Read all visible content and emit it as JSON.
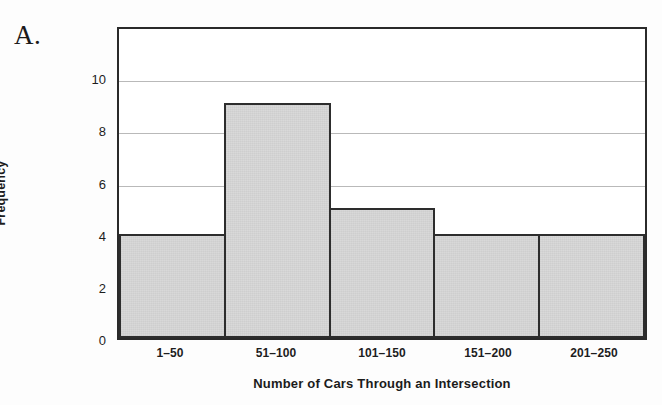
{
  "panel_letter": "A.",
  "chart_data": {
    "type": "bar",
    "title": "",
    "subtitle": "",
    "xlabel": "Number of Cars Through an Intersection",
    "ylabel": "Frequency",
    "categories": [
      "1–50",
      "51–100",
      "101–150",
      "151–200",
      "201–250"
    ],
    "values": [
      4,
      9,
      5,
      4,
      4
    ],
    "ylim": [
      0,
      12
    ],
    "yticks": [
      0,
      2,
      4,
      6,
      8,
      10
    ],
    "ytick_labels": [
      "0",
      "2",
      "4",
      "6",
      "8",
      "10"
    ],
    "gridlines": [
      6,
      8,
      10
    ],
    "grid": true,
    "legend": "none",
    "bar_fill_color": "#d7d7d7",
    "bar_edge_color": "#2d2d2d",
    "axis_color": "#2a2a2a",
    "grid_color": "#b9b9b9",
    "text_color": "#1d1d1d",
    "background_color": "#fdfdfd",
    "plot_background_color": "#ffffff",
    "bar_gap": 0
  }
}
